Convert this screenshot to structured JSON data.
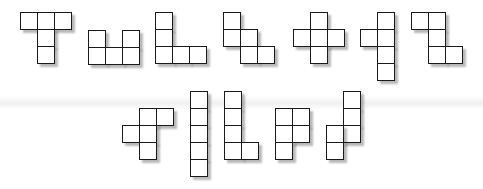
{
  "diagram": {
    "title": "",
    "cell_size": 17,
    "stroke_color": "#1a1a1a",
    "fill_color": "#ffffff",
    "pieces": [
      {
        "name": "T",
        "cells": [
          [
            20,
            12
          ],
          [
            37,
            12
          ],
          [
            54,
            12
          ],
          [
            37,
            29
          ],
          [
            37,
            46
          ]
        ]
      },
      {
        "name": "U",
        "cells": [
          [
            88,
            30
          ],
          [
            122,
            30
          ],
          [
            88,
            47
          ],
          [
            105,
            47
          ],
          [
            122,
            47
          ]
        ]
      },
      {
        "name": "V",
        "cells": [
          [
            155,
            12
          ],
          [
            155,
            29
          ],
          [
            155,
            46
          ],
          [
            172,
            46
          ],
          [
            189,
            46
          ]
        ]
      },
      {
        "name": "W",
        "cells": [
          [
            223,
            12
          ],
          [
            223,
            29
          ],
          [
            240,
            29
          ],
          [
            240,
            46
          ],
          [
            257,
            46
          ]
        ]
      },
      {
        "name": "X",
        "cells": [
          [
            310,
            12
          ],
          [
            293,
            29
          ],
          [
            310,
            29
          ],
          [
            327,
            29
          ],
          [
            310,
            46
          ]
        ]
      },
      {
        "name": "Y",
        "cells": [
          [
            377,
            12
          ],
          [
            360,
            29
          ],
          [
            377,
            29
          ],
          [
            377,
            46
          ],
          [
            377,
            63
          ]
        ]
      },
      {
        "name": "Z",
        "cells": [
          [
            411,
            12
          ],
          [
            428,
            12
          ],
          [
            428,
            29
          ],
          [
            428,
            46
          ],
          [
            445,
            46
          ]
        ]
      },
      {
        "name": "F",
        "cells": [
          [
            139,
            108
          ],
          [
            156,
            108
          ],
          [
            122,
            125
          ],
          [
            139,
            125
          ],
          [
            139,
            142
          ]
        ]
      },
      {
        "name": "I",
        "cells": [
          [
            190,
            91
          ],
          [
            190,
            108
          ],
          [
            190,
            125
          ],
          [
            190,
            142
          ],
          [
            190,
            159
          ]
        ]
      },
      {
        "name": "L",
        "cells": [
          [
            224,
            91
          ],
          [
            224,
            108
          ],
          [
            224,
            125
          ],
          [
            224,
            142
          ],
          [
            241,
            142
          ]
        ]
      },
      {
        "name": "P",
        "cells": [
          [
            275,
            108
          ],
          [
            292,
            108
          ],
          [
            275,
            125
          ],
          [
            292,
            125
          ],
          [
            275,
            142
          ]
        ]
      },
      {
        "name": "N",
        "cells": [
          [
            343,
            91
          ],
          [
            343,
            108
          ],
          [
            343,
            125
          ],
          [
            326,
            125
          ],
          [
            326,
            142
          ]
        ]
      }
    ]
  }
}
